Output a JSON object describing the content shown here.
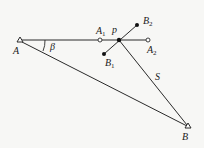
{
  "diagram": {
    "type": "survey-geometry",
    "colors": {
      "line": "#2a2a2a",
      "background": "#f7f7f5"
    },
    "points": {
      "A": {
        "label": "A",
        "x": 20,
        "y": 41,
        "marker": "triangle"
      },
      "A1": {
        "label": "A",
        "sub": "1",
        "x": 100,
        "y": 40,
        "marker": "open-circle"
      },
      "p": {
        "label": "p",
        "x": 119,
        "y": 40,
        "marker": "filled-circle"
      },
      "A2": {
        "label": "A",
        "sub": "2",
        "x": 148,
        "y": 40,
        "marker": "open-circle"
      },
      "B1": {
        "label": "B",
        "sub": "1",
        "x": 104,
        "y": 54,
        "marker": "filled-circle"
      },
      "B2": {
        "label": "B",
        "sub": "2",
        "x": 137,
        "y": 25,
        "marker": "filled-circle"
      },
      "B": {
        "label": "B",
        "x": 188,
        "y": 127,
        "marker": "triangle"
      }
    },
    "angle_label": "β",
    "side_label": "S"
  }
}
